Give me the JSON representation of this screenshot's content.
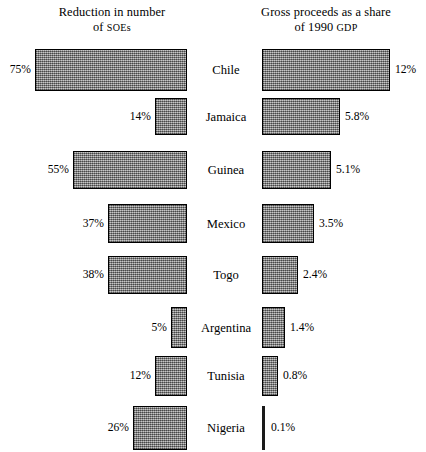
{
  "headers": {
    "left": {
      "line1": "Reduction in number",
      "line2_prefix": "of ",
      "line2_smallcaps": "SOEs"
    },
    "right": {
      "line1": "Gross proceeds as a share",
      "line2_prefix": "of 1990 ",
      "line2_smallcaps": "GDP"
    }
  },
  "style": {
    "bar_fill": "#8f8f8f",
    "bar_border": "#000000",
    "background": "#ffffff",
    "text_color": "#000000"
  },
  "chart_data": {
    "type": "bar",
    "title": "",
    "orientation": "horizontal",
    "grid": false,
    "legend": "none",
    "categories": [
      "Chile",
      "Jamaica",
      "Guinea",
      "Mexico",
      "Togo",
      "Argentina",
      "Tunisia",
      "Nigeria"
    ],
    "series": [
      {
        "name": "Reduction in number of SOEs",
        "unit": "%",
        "align": "right",
        "values": [
          75,
          14,
          55,
          37,
          38,
          5,
          12,
          26
        ],
        "labels": [
          "75%",
          "14%",
          "55%",
          "37%",
          "38%",
          "5%",
          "12%",
          "26%"
        ],
        "bar_px": [
          152,
          32,
          114,
          79,
          79,
          16,
          32,
          54
        ]
      },
      {
        "name": "Gross proceeds as a share of 1990 GDP",
        "unit": "%",
        "align": "left",
        "values": [
          12,
          5.8,
          5.1,
          3.5,
          2.4,
          1.4,
          0.8,
          0.1
        ],
        "labels": [
          "12%",
          "5.8%",
          "5.1%",
          "3.5%",
          "2.4%",
          "1.4%",
          "0.8%",
          "0.1%"
        ],
        "bar_px": [
          128,
          78,
          69,
          52,
          36,
          23,
          16,
          3
        ]
      }
    ],
    "rows": [
      {
        "country": "Chile",
        "left_label": "75%",
        "right_label": "12%",
        "top": 49,
        "height": 42,
        "left_w": 152,
        "right_w": 128
      },
      {
        "country": "Jamaica",
        "left_label": "14%",
        "right_label": "5.8%",
        "top": 98,
        "height": 37,
        "left_w": 32,
        "right_w": 78
      },
      {
        "country": "Guinea",
        "left_label": "55%",
        "right_label": "5.1%",
        "top": 151,
        "height": 38,
        "left_w": 114,
        "right_w": 69
      },
      {
        "country": "Mexico",
        "left_label": "37%",
        "right_label": "3.5%",
        "top": 204,
        "height": 39,
        "left_w": 79,
        "right_w": 52
      },
      {
        "country": "Togo",
        "left_label": "38%",
        "right_label": "2.4%",
        "top": 256,
        "height": 38,
        "left_w": 79,
        "right_w": 36
      },
      {
        "country": "Argentina",
        "left_label": "5%",
        "right_label": "1.4%",
        "top": 307,
        "height": 41,
        "left_w": 16,
        "right_w": 23
      },
      {
        "country": "Tunisia",
        "left_label": "12%",
        "right_label": "0.8%",
        "top": 356,
        "height": 40,
        "left_w": 32,
        "right_w": 16
      },
      {
        "country": "Nigeria",
        "left_label": "26%",
        "right_label": "0.1%",
        "top": 406,
        "height": 44,
        "left_w": 54,
        "right_w": 3
      }
    ]
  }
}
